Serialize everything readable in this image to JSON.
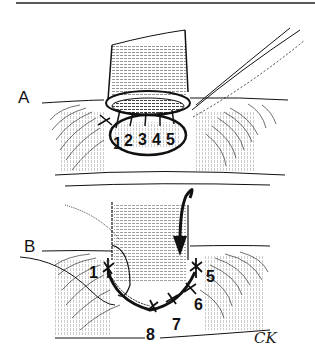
{
  "figure": {
    "type": "surgical-illustration",
    "colors": {
      "ink": "#111111",
      "background": "#ffffff"
    },
    "panels": [
      {
        "label": "A",
        "suture_numbers": [
          "1",
          "2",
          "3",
          "4",
          "5"
        ]
      },
      {
        "label": "B",
        "suture_numbers": [
          "1",
          "5",
          "6",
          "7",
          "8"
        ],
        "annotation": "curved-arrow-rotate-down"
      }
    ],
    "signature": "CK"
  }
}
